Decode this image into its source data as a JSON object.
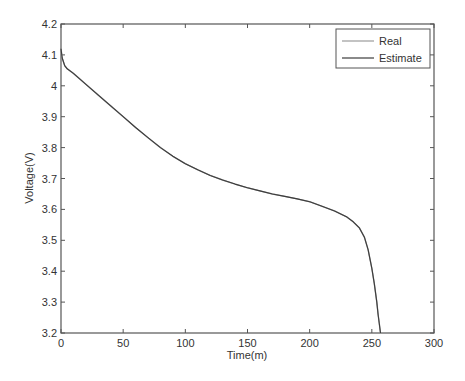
{
  "chart_data": {
    "type": "line",
    "title": "",
    "xlabel": "Time(m)",
    "ylabel": "Voltage(V)",
    "xlim": [
      0,
      300
    ],
    "ylim": [
      3.2,
      4.2
    ],
    "xticks": [
      0,
      50,
      100,
      150,
      200,
      250,
      300
    ],
    "yticks": [
      3.2,
      3.3,
      3.4,
      3.5,
      3.6,
      3.7,
      3.8,
      3.9,
      4.0,
      4.1,
      4.2
    ],
    "xtick_labels": [
      "0",
      "50",
      "100",
      "150",
      "200",
      "250",
      "300"
    ],
    "ytick_labels": [
      "3.2",
      "3.3",
      "3.4",
      "3.5",
      "3.6",
      "3.7",
      "3.8",
      "3.9",
      "4",
      "4.1",
      "4.2"
    ],
    "grid": false,
    "legend_position": "upper right",
    "legend": [
      "Real",
      "Estimate"
    ],
    "series": [
      {
        "name": "Real",
        "color": "#9a9a9a",
        "x": [
          0,
          1,
          3,
          5,
          10,
          20,
          30,
          40,
          50,
          60,
          70,
          80,
          90,
          100,
          110,
          120,
          130,
          140,
          150,
          160,
          170,
          180,
          190,
          200,
          210,
          220,
          230,
          235,
          240,
          244,
          247,
          250,
          252,
          254,
          255,
          256,
          257
        ],
        "y": [
          4.12,
          4.09,
          4.065,
          4.055,
          4.04,
          4.005,
          3.97,
          3.935,
          3.9,
          3.865,
          3.832,
          3.8,
          3.772,
          3.748,
          3.728,
          3.71,
          3.695,
          3.682,
          3.67,
          3.66,
          3.65,
          3.642,
          3.634,
          3.625,
          3.61,
          3.595,
          3.575,
          3.56,
          3.54,
          3.51,
          3.47,
          3.41,
          3.36,
          3.3,
          3.26,
          3.23,
          3.2
        ]
      },
      {
        "name": "Estimate",
        "color": "#3c3c3c",
        "x": [
          0,
          1,
          3,
          5,
          10,
          20,
          30,
          40,
          50,
          60,
          70,
          80,
          90,
          100,
          110,
          120,
          130,
          140,
          150,
          160,
          170,
          180,
          190,
          200,
          210,
          220,
          230,
          235,
          240,
          244,
          247,
          250,
          252,
          254,
          255,
          256,
          257
        ],
        "y": [
          4.12,
          4.09,
          4.065,
          4.055,
          4.04,
          4.005,
          3.97,
          3.935,
          3.9,
          3.865,
          3.832,
          3.8,
          3.772,
          3.748,
          3.728,
          3.71,
          3.695,
          3.682,
          3.67,
          3.66,
          3.65,
          3.642,
          3.634,
          3.625,
          3.61,
          3.595,
          3.575,
          3.56,
          3.54,
          3.51,
          3.47,
          3.41,
          3.36,
          3.3,
          3.26,
          3.23,
          3.2
        ]
      }
    ]
  },
  "colors": {
    "axis": "#555555",
    "background": "#ffffff"
  }
}
